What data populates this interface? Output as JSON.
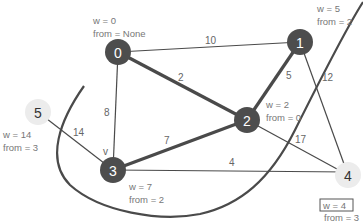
{
  "nodes": [
    {
      "id": "0",
      "label": "0",
      "style": "dark",
      "w": "w = 0",
      "from": "from = None"
    },
    {
      "id": "1",
      "label": "1",
      "style": "dark",
      "w": "w = 5",
      "from": "from = 2"
    },
    {
      "id": "2",
      "label": "2",
      "style": "dark",
      "w": "w = 2",
      "from": "from = 0"
    },
    {
      "id": "3",
      "label": "3",
      "style": "dark",
      "w": "w = 7",
      "from": "from = 2"
    },
    {
      "id": "4",
      "label": "4",
      "style": "light",
      "w": "w = 4",
      "from": "from = 3",
      "w_boxed": true
    },
    {
      "id": "5",
      "label": "5",
      "style": "light",
      "w": "w = 14",
      "from": "from = 3"
    }
  ],
  "edges": [
    {
      "from": "0",
      "to": "1",
      "weight": "10",
      "bold": false
    },
    {
      "from": "0",
      "to": "2",
      "weight": "2",
      "bold": true
    },
    {
      "from": "0",
      "to": "3",
      "weight": "8",
      "bold": false
    },
    {
      "from": "1",
      "to": "2",
      "weight": "5",
      "bold": true
    },
    {
      "from": "1",
      "to": "4",
      "weight": "12",
      "bold": false
    },
    {
      "from": "2",
      "to": "3",
      "weight": "7",
      "bold": true
    },
    {
      "from": "2",
      "to": "4",
      "weight": "17",
      "bold": false
    },
    {
      "from": "3",
      "to": "4",
      "weight": "4",
      "bold": false
    },
    {
      "from": "5",
      "to": "3",
      "weight": "14",
      "bold": false
    }
  ],
  "annotations": {
    "v_marker": "v"
  },
  "colors": {
    "dark_node": "#4d4d4d",
    "light_node": "#ececec",
    "edge": "#4a4a4a",
    "text": "#666666"
  }
}
